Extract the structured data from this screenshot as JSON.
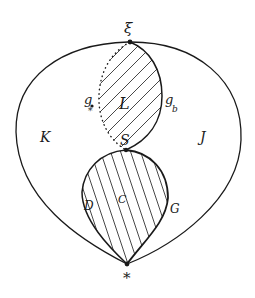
{
  "diagram": {
    "colors": {
      "ink": "#1a1a1a",
      "hatch": "#333333",
      "background": "#ffffff"
    },
    "points": {
      "top": {
        "label": "ξ",
        "x": 130,
        "y": 42
      },
      "middle": {
        "label": "S",
        "x": 126,
        "y": 150
      },
      "bottom": {
        "label": "*",
        "x": 127,
        "y": 264
      }
    },
    "regions": {
      "outer_left": {
        "label": "K"
      },
      "outer_right": {
        "label": "J"
      },
      "upper_loop": {
        "label": "L",
        "hatched": true
      },
      "lower_loop": {
        "label": "C",
        "hatched": true
      }
    },
    "curve_labels": {
      "upper_left_dotted": "g",
      "upper_left_dotted_mark": "*",
      "upper_right": "g",
      "upper_right_subscript": "b",
      "lower_left": "D",
      "lower_right": "G"
    }
  }
}
